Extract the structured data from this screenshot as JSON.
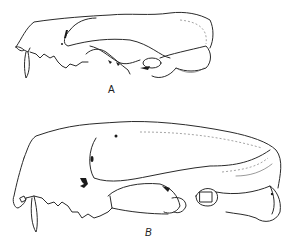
{
  "figure": {
    "panels": [
      {
        "id": "A",
        "label": "A",
        "subject": "skull lateral view (smaller)"
      },
      {
        "id": "B",
        "label": "B",
        "subject": "skull lateral view (larger)"
      }
    ],
    "style": {
      "line_color": "#2a2a2a",
      "background": "#ffffff"
    }
  }
}
